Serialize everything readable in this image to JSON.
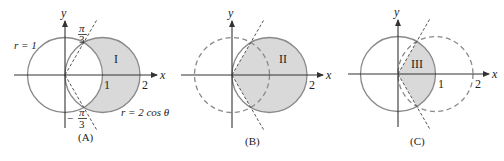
{
  "figure": {
    "colors": {
      "shade": "#d9d9d9",
      "circle_stroke": "#8a8a8a",
      "axis": "#333333"
    },
    "panels": [
      {
        "id": "A",
        "caption": "(A)",
        "axis_x": "x",
        "axis_y": "y",
        "tick_1": "1",
        "tick_2": "2",
        "region": "I",
        "label_unit_circle": "r = 1",
        "label_cos_circle": "r = 2 cos θ",
        "angle_top_num": "π",
        "angle_top_den": "3",
        "angle_bottom_sign": "−",
        "angle_bottom_num": "π",
        "angle_bottom_den": "3"
      },
      {
        "id": "B",
        "caption": "(B)",
        "axis_x": "x",
        "axis_y": "y",
        "tick_2": "2",
        "region": "II"
      },
      {
        "id": "C",
        "caption": "(C)",
        "axis_x": "x",
        "axis_y": "y",
        "tick_1": "1",
        "tick_2": "2",
        "region": "III"
      }
    ]
  }
}
